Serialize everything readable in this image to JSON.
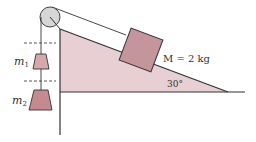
{
  "diagram": {
    "labels": {
      "m1_sym": "m",
      "m1_sub": "1",
      "m2_sym": "m",
      "m2_sub": "2",
      "block_mass": "M = 2 kg",
      "angle": "30°"
    },
    "colors": {
      "incline_fill": "#e8cfd4",
      "block_fill": "#c4959b",
      "m1_fill": "#d4a8ad",
      "m2_fill": "#c48a90",
      "pulley_fill": "#d6d6d6",
      "line": "#333333"
    }
  }
}
